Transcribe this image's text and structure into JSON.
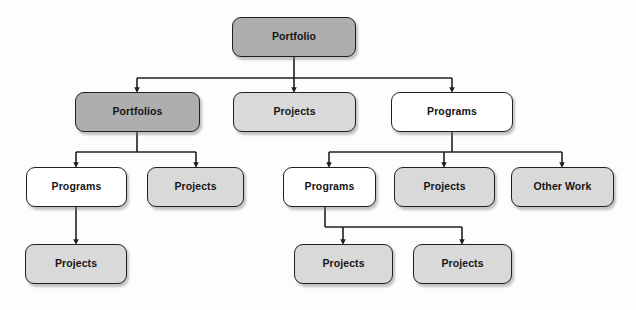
{
  "diagram": {
    "canvas": {
      "width": 636,
      "height": 310,
      "background": "#fdfdfd"
    },
    "colors": {
      "fill_dark": "#aeaeae",
      "fill_light": "#d9d9d9",
      "fill_white": "#ffffff",
      "stroke": "#231f20",
      "text": "#151515"
    },
    "nodes": [
      {
        "id": "n_portfolio",
        "label": "Portfolio",
        "fill": "fill-dark",
        "x": 232,
        "y": 17,
        "w": 124,
        "h": 40,
        "level": 1
      },
      {
        "id": "n_portfolios",
        "label": "Portfolios",
        "fill": "fill-dark",
        "x": 75,
        "y": 92,
        "w": 125,
        "h": 40,
        "level": 2
      },
      {
        "id": "n_projects_r2",
        "label": "Projects",
        "fill": "fill-light",
        "x": 233,
        "y": 92,
        "w": 123,
        "h": 40,
        "level": 2
      },
      {
        "id": "n_programs_r2",
        "label": "Programs",
        "fill": "fill-white",
        "x": 391,
        "y": 92,
        "w": 122,
        "h": 40,
        "level": 2
      },
      {
        "id": "n_programs_l_r3",
        "label": "Programs",
        "fill": "fill-white",
        "x": 26,
        "y": 167,
        "w": 101,
        "h": 40,
        "level": 3
      },
      {
        "id": "n_projects_l_r3",
        "label": "Projects",
        "fill": "fill-light",
        "x": 147,
        "y": 167,
        "w": 97,
        "h": 40,
        "level": 3
      },
      {
        "id": "n_programs_r_r3",
        "label": "Programs",
        "fill": "fill-white",
        "x": 283,
        "y": 167,
        "w": 93,
        "h": 40,
        "level": 3
      },
      {
        "id": "n_projects_r_r3",
        "label": "Projects",
        "fill": "fill-light",
        "x": 394,
        "y": 167,
        "w": 101,
        "h": 40,
        "level": 3
      },
      {
        "id": "n_other_work_r3",
        "label": "Other Work",
        "fill": "fill-light",
        "x": 511,
        "y": 167,
        "w": 103,
        "h": 40,
        "level": 3
      },
      {
        "id": "n_projects_l_r4",
        "label": "Projects",
        "fill": "fill-light",
        "x": 25,
        "y": 244,
        "w": 102,
        "h": 40,
        "level": 4
      },
      {
        "id": "n_projects_r4_a",
        "label": "Projects",
        "fill": "fill-light",
        "x": 294,
        "y": 244,
        "w": 99,
        "h": 40,
        "level": 4
      },
      {
        "id": "n_projects_r4_b",
        "label": "Projects",
        "fill": "fill-light",
        "x": 413,
        "y": 244,
        "w": 99,
        "h": 40,
        "level": 4
      }
    ],
    "edges": [
      {
        "id": "e_portfolio_to_portfolios",
        "from": "n_portfolio",
        "to": "n_portfolios"
      },
      {
        "id": "e_portfolio_to_projects",
        "from": "n_portfolio",
        "to": "n_projects_r2"
      },
      {
        "id": "e_portfolio_to_programs",
        "from": "n_portfolio",
        "to": "n_programs_r2"
      },
      {
        "id": "e_portfolios_to_programs",
        "from": "n_portfolios",
        "to": "n_programs_l_r3"
      },
      {
        "id": "e_portfolios_to_projects",
        "from": "n_portfolios",
        "to": "n_projects_l_r3"
      },
      {
        "id": "e_programs_to_programs",
        "from": "n_programs_r2",
        "to": "n_programs_r_r3"
      },
      {
        "id": "e_programs_to_projects",
        "from": "n_programs_r2",
        "to": "n_projects_r_r3"
      },
      {
        "id": "e_programs_to_otherwork",
        "from": "n_programs_r2",
        "to": "n_other_work_r3"
      },
      {
        "id": "e_programsl_to_projects",
        "from": "n_programs_l_r3",
        "to": "n_projects_l_r4"
      },
      {
        "id": "e_programsr_to_projects_a",
        "from": "n_programs_r_r3",
        "to": "n_projects_r4_a"
      },
      {
        "id": "e_programsr_to_projects_b",
        "from": "n_programs_r_r3",
        "to": "n_projects_r4_b"
      }
    ]
  }
}
